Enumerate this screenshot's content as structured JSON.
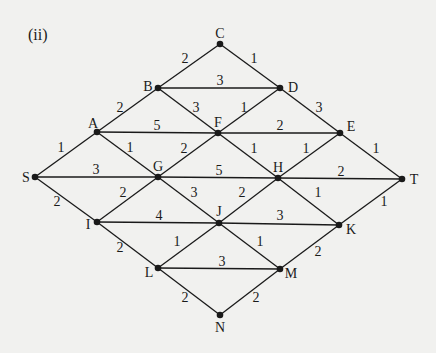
{
  "figure": {
    "part_label": "(ii)",
    "colors": {
      "background": "#f1f1ef",
      "ink": "#1a1a1a"
    }
  },
  "nodes": [
    {
      "id": "C",
      "x": 220,
      "y": 44,
      "lx": 220,
      "ly": 38,
      "anchor": "middle"
    },
    {
      "id": "B",
      "x": 158,
      "y": 88,
      "lx": 148,
      "ly": 91,
      "anchor": "middle"
    },
    {
      "id": "D",
      "x": 280,
      "y": 88,
      "lx": 293,
      "ly": 92,
      "anchor": "middle"
    },
    {
      "id": "A",
      "x": 97,
      "y": 132,
      "lx": 93,
      "ly": 128,
      "anchor": "middle"
    },
    {
      "id": "F",
      "x": 218,
      "y": 133,
      "lx": 218,
      "ly": 127,
      "anchor": "middle"
    },
    {
      "id": "E",
      "x": 340,
      "y": 133,
      "lx": 351,
      "ly": 131,
      "anchor": "middle"
    },
    {
      "id": "S",
      "x": 35,
      "y": 177,
      "lx": 26,
      "ly": 182,
      "anchor": "middle"
    },
    {
      "id": "G",
      "x": 158,
      "y": 177,
      "lx": 158,
      "ly": 171,
      "anchor": "middle"
    },
    {
      "id": "H",
      "x": 278,
      "y": 178,
      "lx": 278,
      "ly": 172,
      "anchor": "middle"
    },
    {
      "id": "T",
      "x": 402,
      "y": 179,
      "lx": 414,
      "ly": 184,
      "anchor": "middle"
    },
    {
      "id": "I",
      "x": 97,
      "y": 222,
      "lx": 88,
      "ly": 229,
      "anchor": "middle"
    },
    {
      "id": "J",
      "x": 219,
      "y": 223,
      "lx": 219,
      "ly": 216,
      "anchor": "middle"
    },
    {
      "id": "K",
      "x": 339,
      "y": 225,
      "lx": 351,
      "ly": 234,
      "anchor": "middle"
    },
    {
      "id": "L",
      "x": 158,
      "y": 268,
      "lx": 149,
      "ly": 277,
      "anchor": "middle"
    },
    {
      "id": "M",
      "x": 280,
      "y": 269,
      "lx": 291,
      "ly": 278,
      "anchor": "middle"
    },
    {
      "id": "N",
      "x": 220,
      "y": 315,
      "lx": 220,
      "ly": 332,
      "anchor": "middle"
    }
  ],
  "edges": [
    {
      "from": "S",
      "to": "A",
      "weight": "1",
      "wx": 61,
      "wy": 152
    },
    {
      "from": "S",
      "to": "G",
      "weight": "3",
      "wx": 96,
      "wy": 174
    },
    {
      "from": "S",
      "to": "I",
      "weight": "2",
      "wx": 57,
      "wy": 206
    },
    {
      "from": "A",
      "to": "B",
      "weight": "2",
      "wx": 120,
      "wy": 112
    },
    {
      "from": "A",
      "to": "F",
      "weight": "5",
      "wx": 157,
      "wy": 130
    },
    {
      "from": "A",
      "to": "G",
      "weight": "1",
      "wx": 130,
      "wy": 152
    },
    {
      "from": "B",
      "to": "C",
      "weight": "2",
      "wx": 185,
      "wy": 63
    },
    {
      "from": "B",
      "to": "D",
      "weight": "3",
      "wx": 220,
      "wy": 85
    },
    {
      "from": "B",
      "to": "F",
      "weight": "3",
      "wx": 196,
      "wy": 112
    },
    {
      "from": "C",
      "to": "D",
      "weight": "1",
      "wx": 254,
      "wy": 63
    },
    {
      "from": "D",
      "to": "F",
      "weight": "1",
      "wx": 244,
      "wy": 112
    },
    {
      "from": "D",
      "to": "E",
      "weight": "3",
      "wx": 319,
      "wy": 112
    },
    {
      "from": "F",
      "to": "E",
      "weight": "2",
      "wx": 280,
      "wy": 130
    },
    {
      "from": "F",
      "to": "G",
      "weight": "2",
      "wx": 184,
      "wy": 153
    },
    {
      "from": "F",
      "to": "H",
      "weight": "1",
      "wx": 254,
      "wy": 153
    },
    {
      "from": "E",
      "to": "H",
      "weight": "1",
      "wx": 306,
      "wy": 153
    },
    {
      "from": "E",
      "to": "T",
      "weight": "1",
      "wx": 376,
      "wy": 153
    },
    {
      "from": "G",
      "to": "H",
      "weight": "5",
      "wx": 219,
      "wy": 175
    },
    {
      "from": "H",
      "to": "T",
      "weight": "2",
      "wx": 341,
      "wy": 176
    },
    {
      "from": "G",
      "to": "I",
      "weight": "2",
      "wx": 123,
      "wy": 197
    },
    {
      "from": "G",
      "to": "J",
      "weight": "3",
      "wx": 194,
      "wy": 197
    },
    {
      "from": "H",
      "to": "J",
      "weight": "2",
      "wx": 242,
      "wy": 197
    },
    {
      "from": "H",
      "to": "K",
      "weight": "1",
      "wx": 318,
      "wy": 197
    },
    {
      "from": "I",
      "to": "J",
      "weight": "4",
      "wx": 159,
      "wy": 220
    },
    {
      "from": "J",
      "to": "K",
      "weight": "3",
      "wx": 280,
      "wy": 220
    },
    {
      "from": "K",
      "to": "T",
      "weight": "1",
      "wx": 384,
      "wy": 206
    },
    {
      "from": "I",
      "to": "L",
      "weight": "2",
      "wx": 120,
      "wy": 252
    },
    {
      "from": "J",
      "to": "L",
      "weight": "1",
      "wx": 177,
      "wy": 246
    },
    {
      "from": "J",
      "to": "M",
      "weight": "1",
      "wx": 260,
      "wy": 246
    },
    {
      "from": "L",
      "to": "M",
      "weight": "3",
      "wx": 222,
      "wy": 266
    },
    {
      "from": "M",
      "to": "K",
      "weight": "2",
      "wx": 318,
      "wy": 256
    },
    {
      "from": "L",
      "to": "N",
      "weight": "2",
      "wx": 185,
      "wy": 302
    },
    {
      "from": "N",
      "to": "M",
      "weight": "2",
      "wx": 256,
      "wy": 302
    }
  ]
}
